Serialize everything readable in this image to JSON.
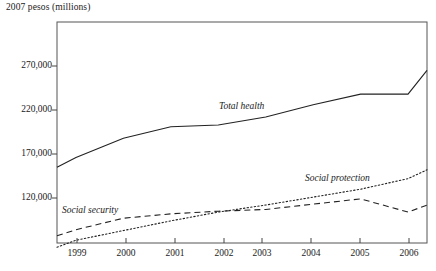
{
  "chart_data": {
    "type": "line",
    "title": "",
    "ylabel": "2007 pesos (millions)",
    "xlabel": "",
    "ylim": [
      95000,
      287000
    ],
    "yticks": [
      120000,
      170000,
      220000,
      270000
    ],
    "ytick_labels": [
      "120,000",
      "170,000",
      "220,000",
      "270,000"
    ],
    "xlim": [
      1998.6,
      2006.4
    ],
    "xticks": [
      1999,
      2000,
      2001,
      2002,
      2003,
      2004,
      2005,
      2006
    ],
    "xtick_labels": [
      "1999",
      "2000",
      "2001",
      "2002",
      "2003",
      "2004",
      "2005",
      "2006"
    ],
    "grid": false,
    "legend": "inline-annotations",
    "series": [
      {
        "name": "Total health",
        "style": "solid",
        "x": [
          1998.6,
          1999,
          2000,
          2001,
          2002,
          2003,
          2004,
          2005,
          2006,
          2006.4
        ],
        "values": [
          155000,
          166000,
          188000,
          201000,
          203000,
          212000,
          226000,
          238000,
          238000,
          265000
        ]
      },
      {
        "name": "Social security",
        "style": "dashed",
        "x": [
          1998.6,
          1999,
          2000,
          2001,
          2002,
          2003,
          2004,
          2005,
          2006,
          2006.4
        ],
        "values": [
          77000,
          84000,
          97000,
          102000,
          105000,
          107000,
          113000,
          119000,
          104000,
          112000
        ]
      },
      {
        "name": "Social protection",
        "style": "dotted",
        "x": [
          1998.6,
          1999,
          2000,
          2001,
          2002,
          2003,
          2004,
          2005,
          2006,
          2006.4
        ],
        "values": [
          64000,
          72000,
          83000,
          94000,
          104000,
          112000,
          121000,
          130000,
          142000,
          152000
        ]
      }
    ],
    "annotations": [
      {
        "text": "Total health",
        "x": 2002.4,
        "y": 216000
      },
      {
        "text": "Social protection",
        "x": 2004.3,
        "y": 140000
      },
      {
        "text": "Social security",
        "x": 1999.2,
        "y": 113000
      }
    ]
  }
}
